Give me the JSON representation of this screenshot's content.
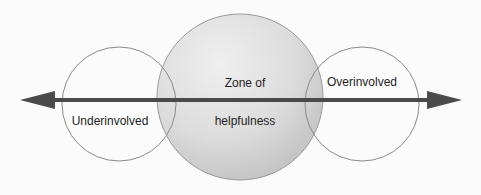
{
  "diagram": {
    "type": "continuum",
    "colors": {
      "background": "#fbfbfb",
      "circle_stroke": "#8a8a8a",
      "center_fill_light": "#e6e6e6",
      "center_fill_dark": "#c4c4c4",
      "arrow": "#4a4a4a",
      "text": "#1e1e1e"
    },
    "nodes": [
      {
        "id": "underinvolved",
        "label": "Underinvolved",
        "shape": "circle",
        "fill": "none"
      },
      {
        "id": "zone",
        "label_line1": "Zone of",
        "label_line2": "helpfulness",
        "shape": "circle",
        "fill": "gradient-gray"
      },
      {
        "id": "overinvolved",
        "label": "Overinvolved",
        "shape": "circle",
        "fill": "none"
      }
    ],
    "axis": {
      "type": "double-headed-arrow",
      "direction": "horizontal"
    }
  }
}
